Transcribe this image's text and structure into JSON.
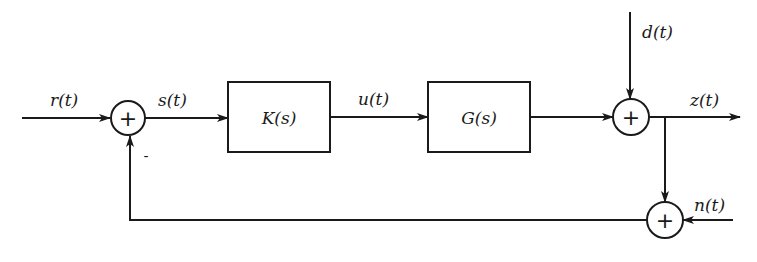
{
  "diagram": {
    "type": "feedback-control-block-diagram",
    "blocks": [
      {
        "id": "controller",
        "label": "K(s)"
      },
      {
        "id": "plant",
        "label": "G(s)"
      }
    ],
    "summing_junctions": [
      {
        "id": "sum-error",
        "symbol": "+",
        "feedback_sign": "-"
      },
      {
        "id": "sum-disturbance",
        "symbol": "+"
      },
      {
        "id": "sum-noise",
        "symbol": "+"
      }
    ],
    "signals": {
      "reference": "r(t)",
      "error": "s(t)",
      "control": "u(t)",
      "disturbance": "d(t)",
      "output": "z(t)",
      "noise": "n(t)"
    },
    "feedback_sign": "-",
    "colors": {
      "stroke": "#1a1a1a",
      "background": "#ffffff"
    }
  }
}
